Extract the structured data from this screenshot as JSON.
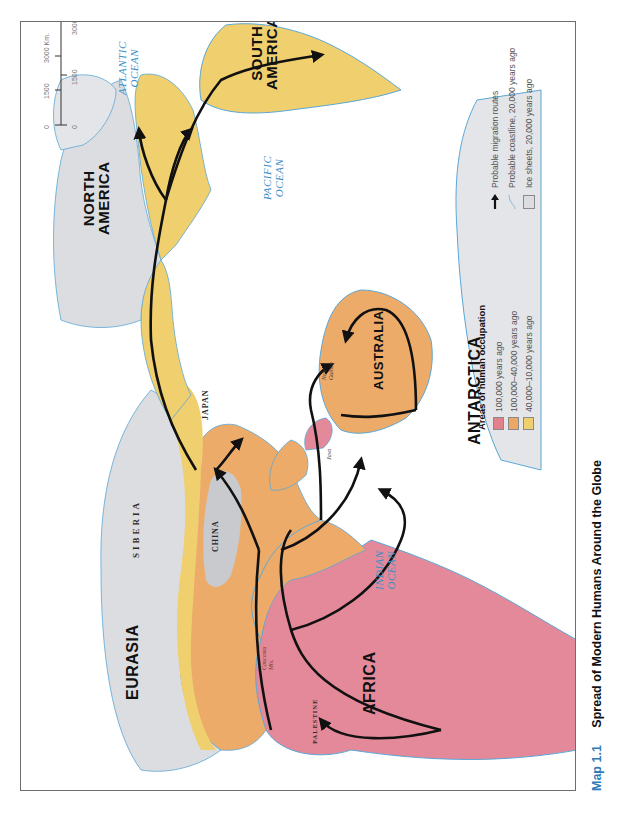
{
  "figure": {
    "number": "Map 1.1",
    "title": "Spread of Modern Humans Around the Globe"
  },
  "colors": {
    "occupation_100000": "#e2808c",
    "occupation_100000_40000": "#eda765",
    "occupation_40000_10000": "#f0cf6e",
    "ice_sheets": "#dcdde0",
    "coastline": "#3a9bd0",
    "ocean_label": "#3d8fc6",
    "caption_number": "#2e7ab5",
    "route": "#111111"
  },
  "labels": {
    "continents": {
      "africa": "AFRICA",
      "eurasia": "EURASIA",
      "australia": "AUSTRALIA",
      "north_america": [
        "NORTH",
        "AMERICA"
      ],
      "south_america": [
        "SOUTH",
        "AMERICA"
      ],
      "antarctica": "ANTARCTICA"
    },
    "oceans": {
      "indian": [
        "INDIAN",
        "OCEAN"
      ],
      "pacific": [
        "PACIFIC",
        "OCEAN"
      ],
      "atlantic": [
        "ATLANTIC",
        "OCEAN"
      ]
    },
    "places": {
      "siberia": "SIBERIA",
      "china": "CHINA",
      "japan": "JAPAN",
      "palestine": "PALESTINE",
      "caucasus": [
        "Caucasus",
        "Mts."
      ],
      "java": "Java",
      "new_guinea": [
        "New",
        "Guinea"
      ]
    }
  },
  "legend": {
    "occupation_title": "Areas of human occupation",
    "occupation_items": [
      {
        "label": "100,000 years ago",
        "color_key": "occupation_100000"
      },
      {
        "label": "100,000–40,000 years ago",
        "color_key": "occupation_100000_40000"
      },
      {
        "label": "40,000–10,000 years ago",
        "color_key": "occupation_40000_10000"
      }
    ],
    "symbol_items": [
      {
        "icon": "arrow-icon",
        "label": "Probable migration routes"
      },
      {
        "icon": "coastline-icon",
        "label": "Probable coastline, 20,000 years ago"
      },
      {
        "icon": "ice-sheet-icon",
        "label": "Ice sheets, 20,000 years ago"
      }
    ]
  },
  "scale_bar": {
    "km": {
      "ticks": [
        "0",
        "1500",
        "3000 Km."
      ]
    },
    "mi": {
      "ticks": [
        "0",
        "1500",
        "3000 Mi."
      ]
    }
  }
}
